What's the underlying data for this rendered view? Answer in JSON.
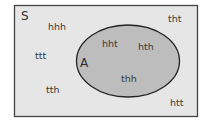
{
  "diagram": {
    "type": "venn",
    "universe": {
      "label": "S",
      "fill": "#e6e6e6",
      "stroke": "#444444"
    },
    "set": {
      "label": "A",
      "fill": "#bdbdbd",
      "stroke": "#222222"
    },
    "outside_elements": [
      {
        "label": "hhh",
        "x": 48,
        "y": 30
      },
      {
        "label": "tht",
        "x": 168,
        "y": 22
      },
      {
        "label": "ttt",
        "x": 35,
        "y": 59
      },
      {
        "label": "tth",
        "x": 46,
        "y": 93
      },
      {
        "label": "htt",
        "x": 170,
        "y": 106
      }
    ],
    "inside_elements": [
      {
        "label": "hht",
        "x": 102,
        "y": 47
      },
      {
        "label": "hth",
        "x": 138,
        "y": 50
      },
      {
        "label": "thh",
        "x": 121,
        "y": 82
      }
    ]
  }
}
